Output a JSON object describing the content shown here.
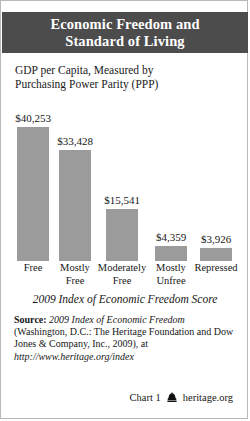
{
  "header": {
    "title_line1": "Economic Freedom and",
    "title_line2": "Standard of Living",
    "band_color": "#4c4c4c"
  },
  "subtitle": {
    "line1": "GDP per Capita, Measured by",
    "line2": "Purchasing Power Parity (PPP)"
  },
  "chart_data": {
    "type": "bar",
    "title": "Economic Freedom and Standard of Living",
    "subtitle": "GDP per Capita, Measured by Purchasing Power Parity (PPP)",
    "xlabel": "2009 Index of Economic Freedom Score",
    "ylabel": "GDP per Capita (PPP)",
    "categories": [
      "Free",
      "Mostly Free",
      "Moderately Free",
      "Mostly Unfree",
      "Repressed"
    ],
    "category_lines": [
      [
        "Free",
        ""
      ],
      [
        "Mostly",
        "Free"
      ],
      [
        "Moderately",
        "Free"
      ],
      [
        "Mostly",
        "Unfree"
      ],
      [
        "Repressed",
        ""
      ]
    ],
    "values": [
      40253,
      33428,
      15541,
      4359,
      3926
    ],
    "value_labels": [
      "$40,253",
      "$33,428",
      "$15,541",
      "$4,359",
      "$3,926"
    ],
    "ylim": [
      0,
      40253
    ],
    "grid": false,
    "legend": null,
    "bar_color": "#9b9b9b"
  },
  "axis_title": "2009 Index of Economic Freedom Score",
  "source": {
    "label": "Source:",
    "italic1": "2009 Index of Economic Freedom",
    "text1": " (Washington, D.C.: The Heritage Foundation and Dow Jones & Company, Inc., 2009), at ",
    "italic2": "http://www.heritage.org/index"
  },
  "footer": {
    "chart_number": "Chart 1",
    "site": "heritage.org",
    "logo": "heritage-bell-icon"
  }
}
